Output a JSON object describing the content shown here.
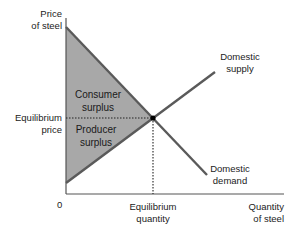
{
  "diagram": {
    "axes": {
      "y_label_line1": "Price",
      "y_label_line2": "of steel",
      "x_label_line1": "Quantity",
      "x_label_line2": "of steel",
      "origin_label": "0"
    },
    "equilibrium": {
      "price_label_line1": "Equilibrium",
      "price_label_line2": "price",
      "quantity_label_line1": "Equilibrium",
      "quantity_label_line2": "quantity"
    },
    "curves": {
      "supply_label_line1": "Domestic",
      "supply_label_line2": "supply",
      "demand_label_line1": "Domestic",
      "demand_label_line2": "demand"
    },
    "regions": {
      "consumer_line1": "Consumer",
      "consumer_line2": "surplus",
      "producer_line1": "Producer",
      "producer_line2": "surplus"
    },
    "colors": {
      "surplus_fill": "#a8a8a8",
      "curve_stroke": "#5a5a5a",
      "axis_stroke": "#555555",
      "equilibrium_dot": "#000000",
      "dotted_guide": "#222222"
    }
  }
}
